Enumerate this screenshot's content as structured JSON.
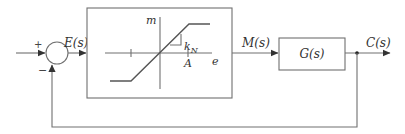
{
  "diagram": {
    "type": "feedback-block-diagram",
    "summing_junction": {
      "plus_sign": "+",
      "minus_sign": "−"
    },
    "signals": {
      "error": "E(s)",
      "manipulated": "M(s)",
      "output": "C(s)"
    },
    "blocks": {
      "nonlinear": {
        "description": "saturation nonlinearity",
        "vertical_axis_label": "m",
        "horizontal_axis_label": "e",
        "slope_label_main": "k",
        "slope_label_sub": "N",
        "saturation_point_label": "A"
      },
      "plant": {
        "label": "G(s)"
      }
    },
    "colors": {
      "lines": "#707070",
      "text": "#333333",
      "background": "#ffffff"
    }
  }
}
